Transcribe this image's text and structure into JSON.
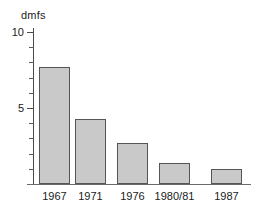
{
  "chart_data": {
    "type": "bar",
    "title": "",
    "xlabel": "",
    "ylabel": "dmfs",
    "categories": [
      "1967",
      "1971",
      "1976",
      "1980/81",
      "1987"
    ],
    "values": [
      7.7,
      4.3,
      2.7,
      1.4,
      1.0
    ],
    "ylim": [
      0,
      10.3
    ],
    "y_major_ticks": [
      5,
      10
    ],
    "y_major_tick_labels": [
      "5",
      "10"
    ],
    "y_minor_ticks": [
      1,
      2,
      3,
      4,
      6,
      7,
      8,
      9
    ],
    "grid": false,
    "legend": false,
    "series": [
      {
        "name": "dmfs",
        "values": [
          7.7,
          4.3,
          2.7,
          1.4,
          1.0
        ]
      }
    ],
    "colors": {
      "bar_fill": "#c9c9c9",
      "bar_edge": "#555555",
      "axis": "#4a4a4a",
      "text": "#1a1a1a",
      "background": "#ffffff"
    }
  }
}
